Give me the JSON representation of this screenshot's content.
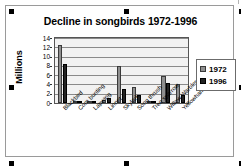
{
  "object": {
    "selection_handles": 8
  },
  "chart_data": {
    "type": "bar",
    "title": "Decline in songbirds 1972-1996",
    "xlabel": "",
    "ylabel": "Millions",
    "ylim": [
      0,
      14
    ],
    "yticks": [
      0,
      2,
      4,
      6,
      8,
      10,
      12,
      14
    ],
    "grid": true,
    "legend_position": "right",
    "categories": [
      "Blackbird",
      "Corn bunting",
      "Lapwing",
      "Linnet",
      "Skylark",
      "Song thrush",
      "Tree sparrow",
      "Willow Warbler",
      "Yellowhammer"
    ],
    "series": [
      {
        "name": "1972",
        "color": "#8f8f8f",
        "values": [
          12.5,
          0.15,
          0.35,
          0.55,
          8.0,
          3.5,
          0.5,
          5.8,
          4.1
        ]
      },
      {
        "name": "1996",
        "color": "#222222",
        "values": [
          8.5,
          0.1,
          0.2,
          1.1,
          3.0,
          1.7,
          0.15,
          4.3,
          1.8
        ]
      }
    ]
  }
}
